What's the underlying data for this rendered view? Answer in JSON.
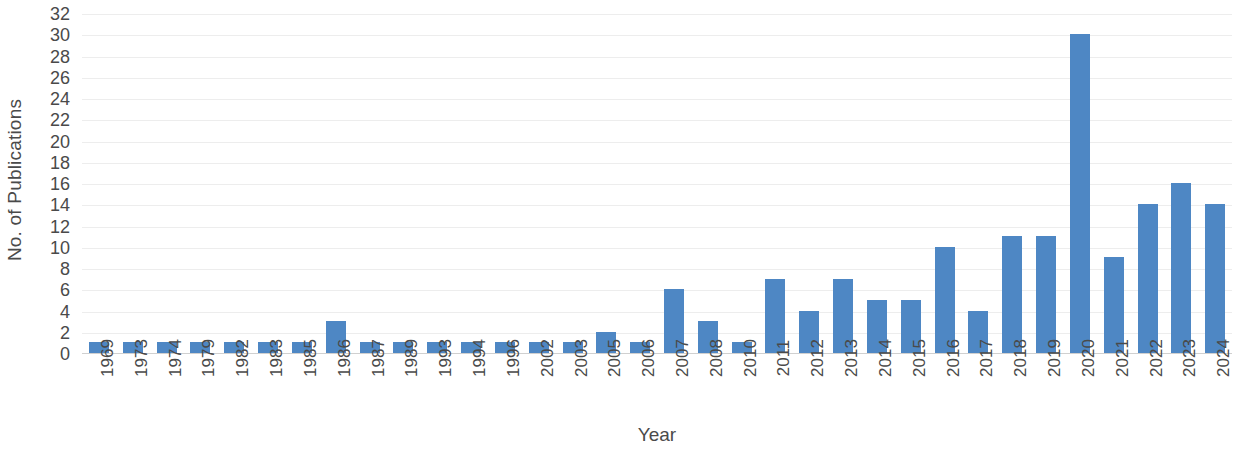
{
  "chart_data": {
    "type": "bar",
    "title": "",
    "xlabel": "Year",
    "ylabel": "No. of Publications",
    "categories": [
      "1969",
      "1973",
      "1974",
      "1979",
      "1982",
      "1983",
      "1985",
      "1986",
      "1987",
      "1989",
      "1993",
      "1994",
      "1996",
      "2002",
      "2003",
      "2005",
      "2006",
      "2007",
      "2008",
      "2010",
      "2011",
      "2012",
      "2013",
      "2014",
      "2015",
      "2016",
      "2017",
      "2018",
      "2019",
      "2020",
      "2021",
      "2022",
      "2023",
      "2024"
    ],
    "values": [
      1,
      1,
      1,
      1,
      1,
      1,
      1,
      3,
      1,
      1,
      1,
      1,
      1,
      1,
      1,
      2,
      1,
      6,
      3,
      1,
      7,
      4,
      7,
      5,
      5,
      10,
      4,
      11,
      11,
      30,
      9,
      14,
      16,
      14
    ],
    "ylim": [
      0,
      32
    ],
    "ytick_step": 2,
    "yticks": [
      "32",
      "30",
      "28",
      "26",
      "24",
      "22",
      "20",
      "18",
      "16",
      "14",
      "12",
      "10",
      "8",
      "6",
      "4",
      "2",
      "0"
    ],
    "grid": true,
    "grid_axis": "y",
    "legend": false,
    "series_color": "#4e87c4",
    "grid_color": "#ededed",
    "axis_color": "#d0d0d0",
    "text_color": "#4a4a4a"
  }
}
